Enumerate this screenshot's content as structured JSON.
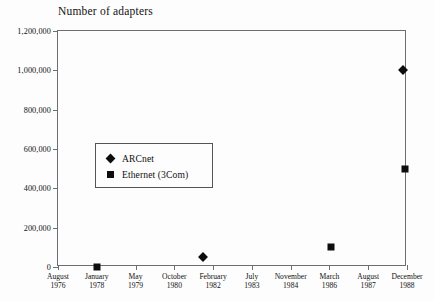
{
  "chart_data": {
    "type": "scatter",
    "title": "Number of adapters",
    "xlabel": "",
    "ylabel": "",
    "ylim": [
      0,
      1200000
    ],
    "grid": false,
    "legend_position": "inside-left",
    "y_ticks": [
      {
        "value": 1200000,
        "label": "1,200,000"
      },
      {
        "value": 1000000,
        "label": "1,000,000"
      },
      {
        "value": 800000,
        "label": "800,000"
      },
      {
        "value": 600000,
        "label": "600,000"
      },
      {
        "value": 400000,
        "label": "400,000"
      },
      {
        "value": 200000,
        "label": "200,000"
      },
      {
        "value": 0,
        "label": "0"
      }
    ],
    "x_ticks": [
      {
        "index": 0,
        "month": "August",
        "year": "1976"
      },
      {
        "index": 1,
        "month": "January",
        "year": "1978"
      },
      {
        "index": 2,
        "month": "May",
        "year": "1979"
      },
      {
        "index": 3,
        "month": "October",
        "year": "1980"
      },
      {
        "index": 4,
        "month": "February",
        "year": "1982"
      },
      {
        "index": 5,
        "month": "July",
        "year": "1983"
      },
      {
        "index": 6,
        "month": "November",
        "year": "1984"
      },
      {
        "index": 7,
        "month": "March",
        "year": "1986"
      },
      {
        "index": 8,
        "month": "August",
        "year": "1987"
      },
      {
        "index": 9,
        "month": "December",
        "year": "1988"
      }
    ],
    "series": [
      {
        "name": "ARCnet",
        "marker": "diamond",
        "color": "#0d0d0d",
        "points": [
          {
            "x_index": 3.75,
            "x_label": "1981",
            "value": 50000
          },
          {
            "x_index": 8.9,
            "x_label": "1988",
            "value": 1000000
          }
        ]
      },
      {
        "name": "Ethernet (3Com)",
        "marker": "square",
        "color": "#0d0d0d",
        "points": [
          {
            "x_index": 1.0,
            "x_label": "January 1978",
            "value": 0
          },
          {
            "x_index": 7.05,
            "x_label": "1985",
            "value": 100000
          },
          {
            "x_index": 8.95,
            "x_label": "1988",
            "value": 500000
          }
        ]
      }
    ]
  },
  "legend": {
    "items": [
      {
        "label": "ARCnet",
        "marker": "diamond"
      },
      {
        "label": "Ethernet (3Com)",
        "marker": "square"
      }
    ]
  }
}
